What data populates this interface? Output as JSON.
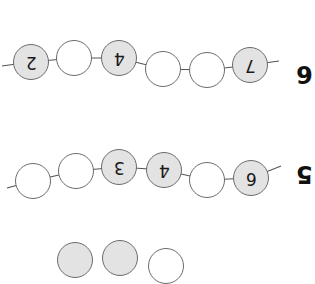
{
  "worksheet": {
    "orientation": "rotated-180",
    "bead_fill_color": "#e3e3e3",
    "bead_empty_color": "#ffffff",
    "bead_border_color": "#6b6b6b",
    "rows": [
      {
        "label": "6",
        "label_pos": [
          296,
          62
        ],
        "beads": [
          {
            "x": 31,
            "y": 62,
            "value": "2",
            "filled": true
          },
          {
            "x": 74,
            "y": 58,
            "value": "",
            "filled": false
          },
          {
            "x": 119,
            "y": 58,
            "value": "4",
            "filled": true
          },
          {
            "x": 163,
            "y": 69,
            "value": "",
            "filled": false
          },
          {
            "x": 207,
            "y": 70,
            "value": "",
            "filled": false
          },
          {
            "x": 250,
            "y": 65,
            "value": "7",
            "filled": true
          }
        ],
        "string_ends": [
          [
            2,
            66
          ],
          [
            279,
            61
          ]
        ]
      },
      {
        "label": "5",
        "label_pos": [
          296,
          162
        ],
        "beads": [
          {
            "x": 33,
            "y": 181,
            "value": "",
            "filled": false
          },
          {
            "x": 76,
            "y": 171,
            "value": "",
            "filled": false
          },
          {
            "x": 119,
            "y": 167,
            "value": "3",
            "filled": true
          },
          {
            "x": 164,
            "y": 170,
            "value": "4",
            "filled": true
          },
          {
            "x": 207,
            "y": 180,
            "value": "",
            "filled": false
          },
          {
            "x": 251,
            "y": 178,
            "value": "6",
            "filled": true
          }
        ],
        "string_ends": [
          [
            7,
            188
          ],
          [
            281,
            166
          ]
        ]
      },
      {
        "label": "",
        "partial": true,
        "beads": [
          {
            "x": 75,
            "y": 260,
            "value": "",
            "filled": true
          },
          {
            "x": 120,
            "y": 258,
            "value": "",
            "filled": true
          },
          {
            "x": 166,
            "y": 266,
            "value": "",
            "filled": false
          }
        ]
      }
    ]
  }
}
